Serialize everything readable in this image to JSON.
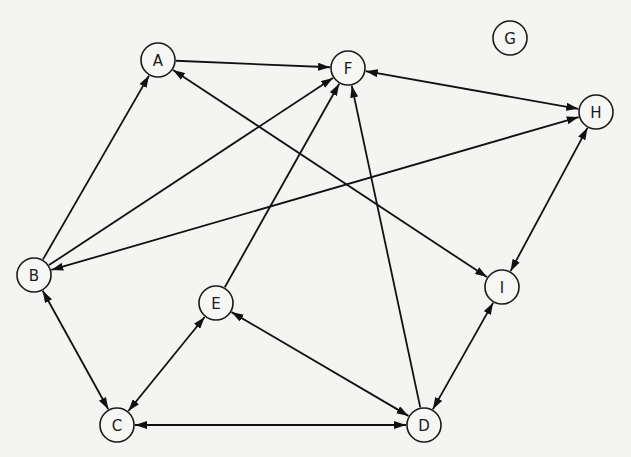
{
  "diagram": {
    "type": "directed-graph",
    "node_radius": 17,
    "colors": {
      "line": "#111111",
      "node_fill": "#f6f6f4",
      "background": "#f4f4f2"
    },
    "nodes": [
      {
        "id": "A",
        "label": "A",
        "x": 158,
        "y": 60
      },
      {
        "id": "F",
        "label": "F",
        "x": 348,
        "y": 68
      },
      {
        "id": "G",
        "label": "G",
        "x": 510,
        "y": 38
      },
      {
        "id": "H",
        "label": "H",
        "x": 596,
        "y": 112
      },
      {
        "id": "B",
        "label": "B",
        "x": 34,
        "y": 275
      },
      {
        "id": "E",
        "label": "E",
        "x": 216,
        "y": 303
      },
      {
        "id": "I",
        "label": "I",
        "x": 502,
        "y": 287
      },
      {
        "id": "C",
        "label": "C",
        "x": 117,
        "y": 425
      },
      {
        "id": "D",
        "label": "D",
        "x": 424,
        "y": 425
      }
    ],
    "edges": [
      {
        "from": "A",
        "to": "F",
        "bidirectional": false
      },
      {
        "from": "B",
        "to": "A",
        "bidirectional": false
      },
      {
        "from": "B",
        "to": "F",
        "bidirectional": false
      },
      {
        "from": "B",
        "to": "H",
        "bidirectional": true
      },
      {
        "from": "A",
        "to": "I",
        "bidirectional": true
      },
      {
        "from": "F",
        "to": "H",
        "bidirectional": true
      },
      {
        "from": "E",
        "to": "F",
        "bidirectional": false
      },
      {
        "from": "D",
        "to": "F",
        "bidirectional": false
      },
      {
        "from": "H",
        "to": "I",
        "bidirectional": true
      },
      {
        "from": "B",
        "to": "C",
        "bidirectional": true
      },
      {
        "from": "C",
        "to": "E",
        "bidirectional": true
      },
      {
        "from": "C",
        "to": "D",
        "bidirectional": true
      },
      {
        "from": "E",
        "to": "D",
        "bidirectional": true
      },
      {
        "from": "I",
        "to": "D",
        "bidirectional": true
      }
    ]
  }
}
